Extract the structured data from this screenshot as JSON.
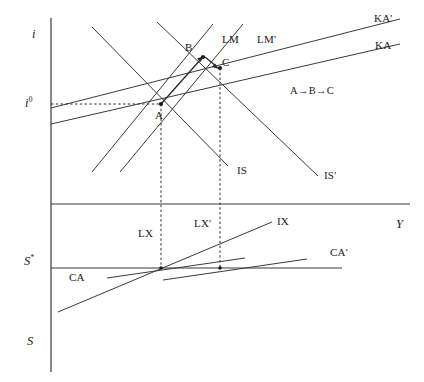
{
  "figure": {
    "type": "is-lm-bp-mundell-fleming-diagram",
    "background_color": "#ffffff",
    "line_color": "#3a3a3a",
    "text_color": "#1a1a1a"
  },
  "axes": {
    "top_panel": {
      "vertical_axis_label": "i",
      "horizontal_axis_label": "Y",
      "marked_rate_label": "i",
      "marked_rate_superscript": "0"
    },
    "bottom_panel": {
      "balance_label": "S",
      "balance_superscript": "*",
      "axis_label": "S"
    }
  },
  "curves": {
    "is": "IS",
    "is_shifted": "IS'",
    "lm": "LM",
    "lm_shifted": "LM'",
    "ka": "KA",
    "ka_shifted": "KA'",
    "ca": "CA",
    "ca_shifted": "CA'",
    "lx": "LX",
    "lx_shifted": "LX'",
    "ix": "IX"
  },
  "equilibria": {
    "point_a": "A",
    "point_b": "B",
    "point_c": "C"
  },
  "annotation": {
    "sequence": "A→B→C"
  }
}
